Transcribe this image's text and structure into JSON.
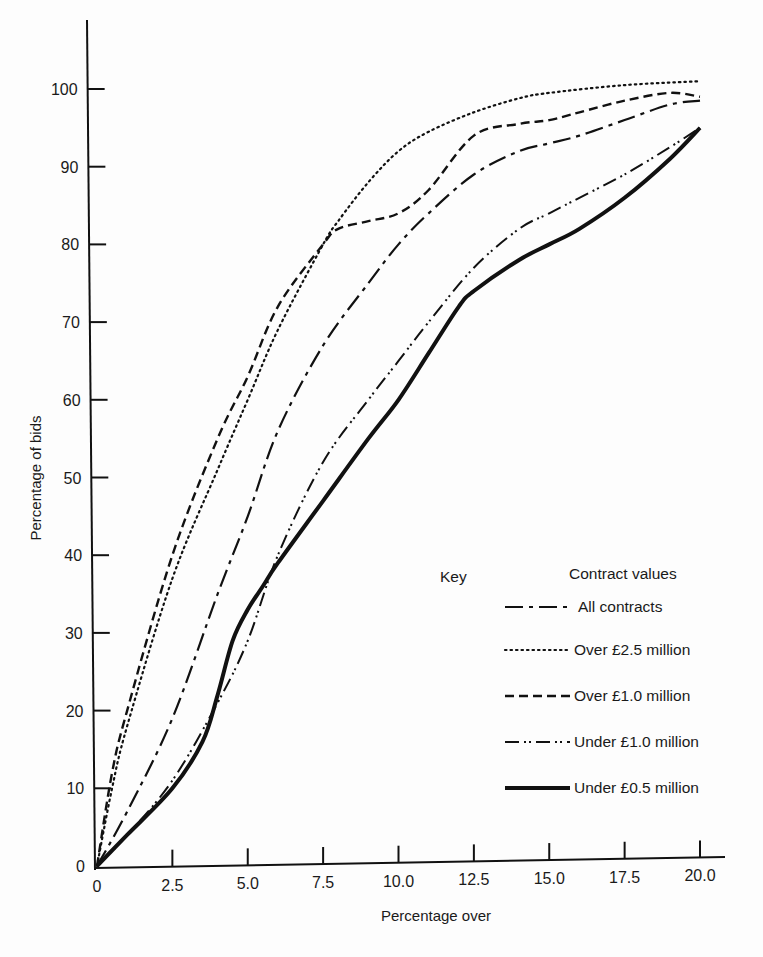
{
  "chart_data": {
    "type": "line",
    "title": "",
    "xlabel": "Percentage over",
    "ylabel": "Percentage of bids",
    "xlim": [
      0,
      20
    ],
    "ylim": [
      0,
      100
    ],
    "x_ticks": [
      "0",
      "2.5",
      "5.0",
      "7.5",
      "10.0",
      "12.5",
      "15.0",
      "17.5",
      "20.0"
    ],
    "y_ticks": [
      "0",
      "10",
      "20",
      "30",
      "40",
      "50",
      "60",
      "70",
      "80",
      "90",
      "100"
    ],
    "grid": false,
    "legend": {
      "position": "right-middle",
      "key_label": "Key",
      "header": "Contract values"
    },
    "series": [
      {
        "name": "All contracts",
        "style": "dash-dot",
        "x": [
          0,
          1,
          2.5,
          4,
          5,
          6,
          7.5,
          9,
          10,
          11,
          12.5,
          14,
          15,
          16,
          17.5,
          19,
          20
        ],
        "y": [
          0,
          7,
          19,
          35,
          45,
          56,
          67,
          75,
          80,
          84,
          89,
          92,
          93,
          94,
          96,
          98,
          98.5
        ]
      },
      {
        "name": "Over £2.5 million",
        "style": "dotted",
        "x": [
          0,
          0.5,
          1,
          2.5,
          4,
          5,
          6,
          7.5,
          8,
          9,
          10,
          11,
          12.5,
          14,
          15,
          17.5,
          20
        ],
        "y": [
          0,
          10,
          18,
          37,
          51,
          60,
          69,
          80,
          83,
          88,
          92,
          94.5,
          97,
          98.8,
          99.5,
          100.5,
          101
        ]
      },
      {
        "name": "Over £1.0 million",
        "style": "dashed",
        "x": [
          0,
          0.5,
          1,
          2.5,
          4,
          5,
          6,
          7.5,
          8,
          9,
          10,
          11,
          12.5,
          14,
          15,
          16,
          17.5,
          19,
          20
        ],
        "y": [
          0,
          12,
          20,
          40,
          55,
          63,
          72,
          80,
          82,
          83,
          84,
          87,
          94,
          95.5,
          96,
          97,
          98.5,
          99.5,
          99
        ]
      },
      {
        "name": "Under £1.0 million",
        "style": "dash-dot-dot",
        "x": [
          0,
          1,
          2.5,
          4,
          5,
          6,
          7.5,
          9,
          10,
          11,
          12.5,
          14,
          15,
          16,
          17.5,
          19,
          20
        ],
        "y": [
          0,
          4,
          11,
          21,
          29,
          40,
          52,
          60,
          65,
          70,
          77,
          82,
          84,
          86,
          89,
          92.5,
          95
        ]
      },
      {
        "name": "Under £0.5 million",
        "style": "solid-thick",
        "x": [
          0,
          1,
          2.5,
          3.5,
          4,
          4.5,
          5,
          5.5,
          6,
          7.5,
          9,
          10,
          11,
          12,
          12.5,
          14,
          15,
          16,
          17.5,
          19,
          20
        ],
        "y": [
          0,
          4,
          10,
          16,
          22,
          29,
          33,
          36,
          39,
          47,
          55,
          60,
          66,
          72,
          74,
          78,
          80,
          82,
          86,
          91,
          95
        ]
      }
    ]
  }
}
